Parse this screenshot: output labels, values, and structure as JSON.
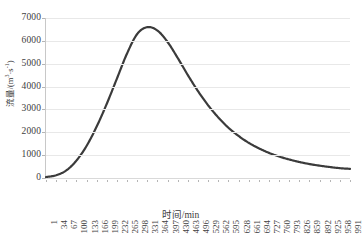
{
  "chart_data": {
    "type": "line",
    "title": "",
    "xlabel": "时间/min",
    "ylabel": "流量/(m³·s⁻¹)",
    "ylabel_main": "流量/(m",
    "ylabel_sup1": "3",
    "ylabel_mid": "·s",
    "ylabel_sup2": "-1",
    "ylabel_end": ")",
    "grid": true,
    "legend": "none",
    "xlim": [
      1,
      991
    ],
    "ylim": [
      0,
      7000
    ],
    "yticks": [
      0,
      1000,
      2000,
      3000,
      4000,
      5000,
      6000,
      7000
    ],
    "ytick_labels": [
      "0",
      "1000",
      "2000",
      "3000",
      "4000",
      "5000",
      "6000",
      "7000"
    ],
    "xticks": [
      1,
      34,
      67,
      100,
      133,
      166,
      199,
      232,
      265,
      298,
      331,
      364,
      397,
      430,
      463,
      496,
      529,
      562,
      595,
      628,
      661,
      694,
      727,
      760,
      793,
      826,
      859,
      892,
      925,
      958,
      991
    ],
    "xtick_labels": [
      "1",
      "34",
      "67",
      "100",
      "133",
      "166",
      "199",
      "232",
      "265",
      "298",
      "331",
      "364",
      "397",
      "430",
      "463",
      "496",
      "529",
      "562",
      "595",
      "628",
      "661",
      "694",
      "727",
      "760",
      "793",
      "826",
      "859",
      "892",
      "925",
      "958",
      "991"
    ],
    "series": [
      {
        "name": "流量",
        "color": "#3b3b3b",
        "line_width": 2.2,
        "x": [
          1,
          34,
          67,
          100,
          133,
          166,
          199,
          232,
          265,
          298,
          331,
          364,
          397,
          430,
          463,
          496,
          529,
          562,
          595,
          628,
          661,
          694,
          727,
          760,
          793,
          826,
          859,
          892,
          925,
          958,
          991
        ],
        "values": [
          40,
          120,
          330,
          760,
          1400,
          2250,
          3250,
          4350,
          5450,
          6300,
          6600,
          6450,
          5950,
          5250,
          4500,
          3800,
          3180,
          2650,
          2200,
          1840,
          1540,
          1300,
          1100,
          940,
          810,
          700,
          610,
          540,
          480,
          430,
          400
        ]
      }
    ],
    "peak": {
      "x": 331,
      "y": 6600
    }
  },
  "axes": {
    "y_tick_count": 8,
    "x_tick_count": 31
  }
}
